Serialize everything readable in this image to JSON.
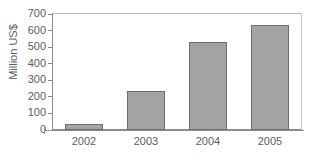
{
  "chart_data": {
    "type": "bar",
    "title": "",
    "subtitle": "",
    "xlabel": "",
    "ylabel": "Million US$",
    "categories": [
      "2002",
      "2003",
      "2004",
      "2005"
    ],
    "values": [
      35,
      235,
      530,
      635
    ],
    "series": [
      {
        "name": "Million US$",
        "values": [
          35,
          235,
          530,
          635
        ]
      }
    ],
    "ylim": [
      0,
      700
    ],
    "ytick_labels": [
      "700",
      "600",
      "500",
      "400",
      "300",
      "200",
      "100",
      "0"
    ],
    "ytick_values": [
      700,
      600,
      500,
      400,
      300,
      200,
      100,
      0
    ],
    "ytick_interval": 100,
    "grid": false,
    "legend": false,
    "legend_position": "none",
    "bar_color": "#a3a3a3",
    "bar_border_color": "#6d6d6d",
    "axis_color": "#8c8c8c",
    "text_color": "#5d5d5d",
    "background_color": "#ffffff"
  }
}
